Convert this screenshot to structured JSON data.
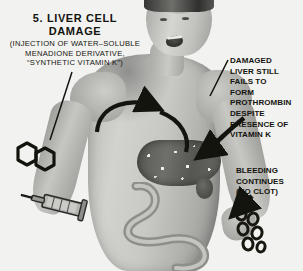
{
  "figure": {
    "number": "5.",
    "title_line1": "5.  LIVER CELL",
    "title_line2": "DAMAGE",
    "subtitle_line1": "(INJECTION OF WATER–SOLUBLE",
    "subtitle_line2": "MENADIONE DERIVATIVE,",
    "subtitle_line3": "“SYNTHETIC VITAMIN K”)"
  },
  "annotations": {
    "liver_note": {
      "line1": "DAMAGED",
      "line2": "LIVER STILL",
      "line3": "FAILS TO",
      "line4": "FORM",
      "line5": "PROTHROMBIN",
      "line6": "DESPITE",
      "line7": "PRESENCE OF",
      "line8": "VITAMIN K"
    },
    "bleeding_note": {
      "line1": "BLEEDING",
      "line2": "CONTINUES",
      "line3": "(NO CLOT)"
    }
  },
  "illustration": {
    "subject": "male-torso-anatomical-figure",
    "organs": [
      "liver",
      "gallbladder",
      "intestine"
    ],
    "objects": [
      "syringe",
      "naphthoquinone-ring-structure",
      "blood-drops"
    ],
    "arrows": [
      "circulation-arrow",
      "liver-pointer-arrow",
      "bleeding-pointer-arrow",
      "title-leader-line"
    ],
    "style": "halftone-grayscale-medical-diagram"
  },
  "colors": {
    "background": "#f2f2f0",
    "ink": "#14140f",
    "skin_mid": "#c2c2be",
    "organ_dark": "#57574f"
  }
}
